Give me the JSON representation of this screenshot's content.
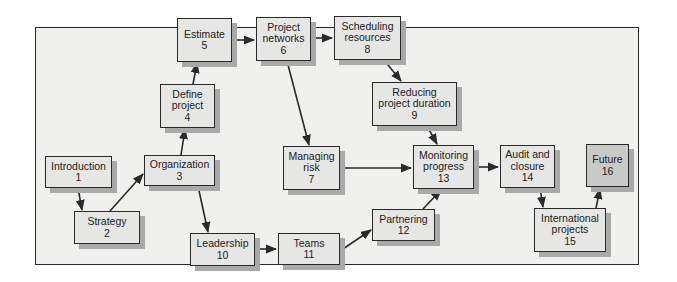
{
  "diagram": {
    "type": "flowchart",
    "colors": {
      "box_fill": "#e6e6e4",
      "box_fill_highlight": "#c9c9c7",
      "frame_fill": "#f0f0ef",
      "shadow": "#a9a9a9",
      "line": "#2a2a2a"
    },
    "nodes": [
      {
        "id": "1",
        "label_lines": [
          "Introduction"
        ],
        "number": "1"
      },
      {
        "id": "2",
        "label_lines": [
          "Strategy"
        ],
        "number": "2"
      },
      {
        "id": "3",
        "label_lines": [
          "Organization"
        ],
        "number": "3"
      },
      {
        "id": "4",
        "label_lines": [
          "Define",
          "project"
        ],
        "number": "4"
      },
      {
        "id": "5",
        "label_lines": [
          "Estimate"
        ],
        "number": "5"
      },
      {
        "id": "6",
        "label_lines": [
          "Project",
          "networks"
        ],
        "number": "6"
      },
      {
        "id": "7",
        "label_lines": [
          "Managing",
          "risk"
        ],
        "number": "7"
      },
      {
        "id": "8",
        "label_lines": [
          "Scheduling",
          "resources"
        ],
        "number": "8"
      },
      {
        "id": "9",
        "label_lines": [
          "Reducing",
          "project duration"
        ],
        "number": "9"
      },
      {
        "id": "10",
        "label_lines": [
          "Leadership"
        ],
        "number": "10"
      },
      {
        "id": "11",
        "label_lines": [
          "Teams"
        ],
        "number": "11"
      },
      {
        "id": "12",
        "label_lines": [
          "Partnering"
        ],
        "number": "12"
      },
      {
        "id": "13",
        "label_lines": [
          "Monitoring",
          "progress"
        ],
        "number": "13"
      },
      {
        "id": "14",
        "label_lines": [
          "Audit and",
          "closure"
        ],
        "number": "14"
      },
      {
        "id": "15",
        "label_lines": [
          "International",
          "projects"
        ],
        "number": "15"
      },
      {
        "id": "16",
        "label_lines": [
          "Future"
        ],
        "number": "16"
      }
    ],
    "edges": [
      {
        "from": "1",
        "to": "2"
      },
      {
        "from": "2",
        "to": "3"
      },
      {
        "from": "3",
        "to": "4"
      },
      {
        "from": "4",
        "to": "5"
      },
      {
        "from": "5",
        "to": "6"
      },
      {
        "from": "6",
        "to": "8"
      },
      {
        "from": "6",
        "to": "7"
      },
      {
        "from": "8",
        "to": "9"
      },
      {
        "from": "9",
        "to": "13"
      },
      {
        "from": "7",
        "to": "13"
      },
      {
        "from": "3",
        "to": "10"
      },
      {
        "from": "10",
        "to": "11"
      },
      {
        "from": "11",
        "to": "12"
      },
      {
        "from": "12",
        "to": "13"
      },
      {
        "from": "13",
        "to": "14"
      },
      {
        "from": "14",
        "to": "15"
      },
      {
        "from": "15",
        "to": "16"
      }
    ]
  },
  "n": {
    "n1": {
      "l1": "Introduction",
      "num": "1"
    },
    "n2": {
      "l1": "Strategy",
      "num": "2"
    },
    "n3": {
      "l1": "Organization",
      "num": "3"
    },
    "n4": {
      "l1": "Define",
      "l2": "project",
      "num": "4"
    },
    "n5": {
      "l1": "Estimate",
      "num": "5"
    },
    "n6": {
      "l1": "Project",
      "l2": "networks",
      "num": "6"
    },
    "n7": {
      "l1": "Managing",
      "l2": "risk",
      "num": "7"
    },
    "n8": {
      "l1": "Scheduling",
      "l2": "resources",
      "num": "8"
    },
    "n9": {
      "l1": "Reducing",
      "l2": "project duration",
      "num": "9"
    },
    "n10": {
      "l1": "Leadership",
      "num": "10"
    },
    "n11": {
      "l1": "Teams",
      "num": "11"
    },
    "n12": {
      "l1": "Partnering",
      "num": "12"
    },
    "n13": {
      "l1": "Monitoring",
      "l2": "progress",
      "num": "13"
    },
    "n14": {
      "l1": "Audit and",
      "l2": "closure",
      "num": "14"
    },
    "n15": {
      "l1": "International",
      "l2": "projects",
      "num": "15"
    },
    "n16": {
      "l1": "Future",
      "num": "16"
    }
  }
}
